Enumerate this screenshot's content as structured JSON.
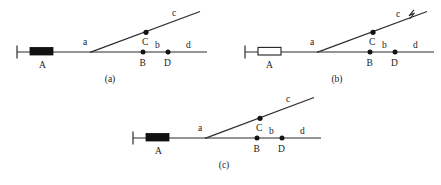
{
  "figure": {
    "background_color": "#ffffff",
    "ink_color": "#1a1a1a",
    "panels": [
      {
        "id": "panel-a",
        "caption": "(a)",
        "block_style": "filled",
        "has_break_marker": false,
        "labels": {
          "block": "A",
          "segment_a": "a",
          "segment_b": "b",
          "segment_c": "c",
          "segment_d": "d",
          "point_b": "B",
          "point_c": "C",
          "point_d": "D"
        }
      },
      {
        "id": "panel-b",
        "caption": "(b)",
        "block_style": "hollow",
        "has_break_marker": true,
        "labels": {
          "block": "A",
          "segment_a": "a",
          "segment_b": "b",
          "segment_c": "c",
          "segment_d": "d",
          "point_b": "B",
          "point_c": "C",
          "point_d": "D"
        }
      },
      {
        "id": "panel-c",
        "caption": "(c)",
        "block_style": "filled",
        "has_break_marker": false,
        "labels": {
          "block": "A",
          "segment_a": "a",
          "segment_b": "b",
          "segment_c": "c",
          "segment_d": "d",
          "point_b": "B",
          "point_c": "C",
          "point_d": "D"
        }
      }
    ]
  }
}
